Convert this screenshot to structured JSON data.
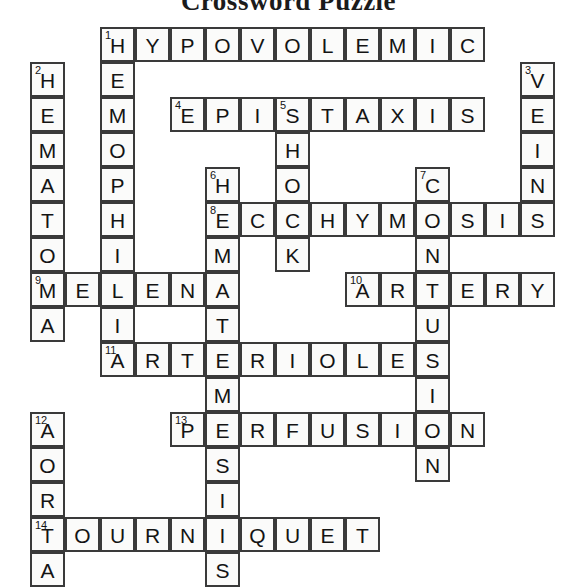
{
  "title": "Crossword Puzzle",
  "grid": {
    "cell_size": 35,
    "origin_x": 30,
    "origin_y": 27,
    "columns": 15,
    "rows": 16,
    "border_color": "#3a3a3a",
    "cell_fill": "#fbfbfa",
    "text_color": "#141414"
  },
  "entries": [
    {
      "number": 1,
      "direction": "across",
      "answer": "HYPOVOLEMIC",
      "row": 0,
      "col": 2,
      "length": 11
    },
    {
      "number": 1,
      "direction": "down",
      "answer": "HEMOPHILIA",
      "row": 0,
      "col": 2,
      "length": 10
    },
    {
      "number": 2,
      "direction": "down",
      "answer": "HEMATOMA",
      "row": 1,
      "col": 0,
      "length": 8
    },
    {
      "number": 3,
      "direction": "down",
      "answer": "VEINS",
      "row": 1,
      "col": 14,
      "length": 5
    },
    {
      "number": 4,
      "direction": "across",
      "answer": "EPISTAXIS",
      "row": 2,
      "col": 4,
      "length": 9
    },
    {
      "number": 5,
      "direction": "down",
      "answer": "SHOCK",
      "row": 2,
      "col": 7,
      "length": 5
    },
    {
      "number": 6,
      "direction": "down",
      "answer": "HEMATEMESIS",
      "row": 4,
      "col": 5,
      "length": 11
    },
    {
      "number": 7,
      "direction": "down",
      "answer": "CONTUSION",
      "row": 4,
      "col": 11,
      "length": 9
    },
    {
      "number": 8,
      "direction": "across",
      "answer": "ECCHYMOSIS",
      "row": 5,
      "col": 5,
      "length": 10
    },
    {
      "number": 9,
      "direction": "across",
      "answer": "MELENA",
      "row": 7,
      "col": 0,
      "length": 6
    },
    {
      "number": 10,
      "direction": "across",
      "answer": "ARTERY",
      "row": 7,
      "col": 9,
      "length": 6
    },
    {
      "number": 11,
      "direction": "across",
      "answer": "ARTERIOLES",
      "row": 9,
      "col": 2,
      "length": 10
    },
    {
      "number": 12,
      "direction": "down",
      "answer": "AORTA",
      "row": 11,
      "col": 0,
      "length": 5
    },
    {
      "number": 13,
      "direction": "across",
      "answer": "PERFUSION",
      "row": 12,
      "col": 4,
      "length": 9
    },
    {
      "number": 14,
      "direction": "across",
      "answer": "TOURNIQUET",
      "row": 14,
      "col": 0,
      "length": 10
    }
  ],
  "cells": [
    {
      "row": 0,
      "col": 2,
      "letter": "H",
      "number": 1
    },
    {
      "row": 0,
      "col": 3,
      "letter": "Y"
    },
    {
      "row": 0,
      "col": 4,
      "letter": "P"
    },
    {
      "row": 0,
      "col": 5,
      "letter": "O"
    },
    {
      "row": 0,
      "col": 6,
      "letter": "V"
    },
    {
      "row": 0,
      "col": 7,
      "letter": "O"
    },
    {
      "row": 0,
      "col": 8,
      "letter": "L"
    },
    {
      "row": 0,
      "col": 9,
      "letter": "E"
    },
    {
      "row": 0,
      "col": 10,
      "letter": "M"
    },
    {
      "row": 0,
      "col": 11,
      "letter": "I"
    },
    {
      "row": 0,
      "col": 12,
      "letter": "C"
    },
    {
      "row": 1,
      "col": 0,
      "letter": "H",
      "number": 2
    },
    {
      "row": 1,
      "col": 2,
      "letter": "E"
    },
    {
      "row": 1,
      "col": 14,
      "letter": "V",
      "number": 3
    },
    {
      "row": 2,
      "col": 0,
      "letter": "E"
    },
    {
      "row": 2,
      "col": 2,
      "letter": "M"
    },
    {
      "row": 2,
      "col": 4,
      "letter": "E",
      "number": 4
    },
    {
      "row": 2,
      "col": 5,
      "letter": "P"
    },
    {
      "row": 2,
      "col": 6,
      "letter": "I"
    },
    {
      "row": 2,
      "col": 7,
      "letter": "S",
      "number": 5
    },
    {
      "row": 2,
      "col": 8,
      "letter": "T"
    },
    {
      "row": 2,
      "col": 9,
      "letter": "A"
    },
    {
      "row": 2,
      "col": 10,
      "letter": "X"
    },
    {
      "row": 2,
      "col": 11,
      "letter": "I"
    },
    {
      "row": 2,
      "col": 12,
      "letter": "S"
    },
    {
      "row": 2,
      "col": 14,
      "letter": "E"
    },
    {
      "row": 3,
      "col": 0,
      "letter": "M"
    },
    {
      "row": 3,
      "col": 2,
      "letter": "O"
    },
    {
      "row": 3,
      "col": 7,
      "letter": "H"
    },
    {
      "row": 3,
      "col": 14,
      "letter": "I"
    },
    {
      "row": 4,
      "col": 0,
      "letter": "A"
    },
    {
      "row": 4,
      "col": 2,
      "letter": "P"
    },
    {
      "row": 4,
      "col": 5,
      "letter": "H",
      "number": 6
    },
    {
      "row": 4,
      "col": 7,
      "letter": "O"
    },
    {
      "row": 4,
      "col": 11,
      "letter": "C",
      "number": 7
    },
    {
      "row": 4,
      "col": 14,
      "letter": "N"
    },
    {
      "row": 5,
      "col": 0,
      "letter": "T"
    },
    {
      "row": 5,
      "col": 2,
      "letter": "H"
    },
    {
      "row": 5,
      "col": 5,
      "letter": "E",
      "number": 8
    },
    {
      "row": 5,
      "col": 6,
      "letter": "C"
    },
    {
      "row": 5,
      "col": 7,
      "letter": "C"
    },
    {
      "row": 5,
      "col": 8,
      "letter": "H"
    },
    {
      "row": 5,
      "col": 9,
      "letter": "Y"
    },
    {
      "row": 5,
      "col": 10,
      "letter": "M"
    },
    {
      "row": 5,
      "col": 11,
      "letter": "O"
    },
    {
      "row": 5,
      "col": 12,
      "letter": "S"
    },
    {
      "row": 5,
      "col": 13,
      "letter": "I"
    },
    {
      "row": 5,
      "col": 14,
      "letter": "S"
    },
    {
      "row": 6,
      "col": 0,
      "letter": "O"
    },
    {
      "row": 6,
      "col": 2,
      "letter": "I"
    },
    {
      "row": 6,
      "col": 5,
      "letter": "M"
    },
    {
      "row": 6,
      "col": 7,
      "letter": "K"
    },
    {
      "row": 6,
      "col": 11,
      "letter": "N"
    },
    {
      "row": 7,
      "col": 0,
      "letter": "M",
      "number": 9
    },
    {
      "row": 7,
      "col": 1,
      "letter": "E"
    },
    {
      "row": 7,
      "col": 2,
      "letter": "L"
    },
    {
      "row": 7,
      "col": 3,
      "letter": "E"
    },
    {
      "row": 7,
      "col": 4,
      "letter": "N"
    },
    {
      "row": 7,
      "col": 5,
      "letter": "A"
    },
    {
      "row": 7,
      "col": 9,
      "letter": "A",
      "number": 10
    },
    {
      "row": 7,
      "col": 10,
      "letter": "R"
    },
    {
      "row": 7,
      "col": 11,
      "letter": "T"
    },
    {
      "row": 7,
      "col": 12,
      "letter": "E"
    },
    {
      "row": 7,
      "col": 13,
      "letter": "R"
    },
    {
      "row": 7,
      "col": 14,
      "letter": "Y"
    },
    {
      "row": 8,
      "col": 0,
      "letter": "A"
    },
    {
      "row": 8,
      "col": 2,
      "letter": "I"
    },
    {
      "row": 8,
      "col": 5,
      "letter": "T"
    },
    {
      "row": 8,
      "col": 11,
      "letter": "U"
    },
    {
      "row": 9,
      "col": 2,
      "letter": "A",
      "number": 11
    },
    {
      "row": 9,
      "col": 3,
      "letter": "R"
    },
    {
      "row": 9,
      "col": 4,
      "letter": "T"
    },
    {
      "row": 9,
      "col": 5,
      "letter": "E"
    },
    {
      "row": 9,
      "col": 6,
      "letter": "R"
    },
    {
      "row": 9,
      "col": 7,
      "letter": "I"
    },
    {
      "row": 9,
      "col": 8,
      "letter": "O"
    },
    {
      "row": 9,
      "col": 9,
      "letter": "L"
    },
    {
      "row": 9,
      "col": 10,
      "letter": "E"
    },
    {
      "row": 9,
      "col": 11,
      "letter": "S"
    },
    {
      "row": 10,
      "col": 5,
      "letter": "M"
    },
    {
      "row": 10,
      "col": 11,
      "letter": "I"
    },
    {
      "row": 11,
      "col": 0,
      "letter": "A",
      "number": 12
    },
    {
      "row": 11,
      "col": 4,
      "letter": "P",
      "number": 13
    },
    {
      "row": 11,
      "col": 5,
      "letter": "E"
    },
    {
      "row": 11,
      "col": 6,
      "letter": "R"
    },
    {
      "row": 11,
      "col": 7,
      "letter": "F"
    },
    {
      "row": 11,
      "col": 8,
      "letter": "U"
    },
    {
      "row": 11,
      "col": 9,
      "letter": "S"
    },
    {
      "row": 11,
      "col": 10,
      "letter": "I"
    },
    {
      "row": 11,
      "col": 11,
      "letter": "O"
    },
    {
      "row": 11,
      "col": 12,
      "letter": "N"
    },
    {
      "row": 12,
      "col": 0,
      "letter": "O"
    },
    {
      "row": 12,
      "col": 5,
      "letter": "S"
    },
    {
      "row": 12,
      "col": 11,
      "letter": "N"
    },
    {
      "row": 13,
      "col": 0,
      "letter": "R"
    },
    {
      "row": 13,
      "col": 5,
      "letter": "I"
    },
    {
      "row": 14,
      "col": 0,
      "letter": "T",
      "number": 14
    },
    {
      "row": 14,
      "col": 1,
      "letter": "O"
    },
    {
      "row": 14,
      "col": 2,
      "letter": "U"
    },
    {
      "row": 14,
      "col": 3,
      "letter": "R"
    },
    {
      "row": 14,
      "col": 4,
      "letter": "N"
    },
    {
      "row": 14,
      "col": 5,
      "letter": "I"
    },
    {
      "row": 14,
      "col": 6,
      "letter": "Q"
    },
    {
      "row": 14,
      "col": 7,
      "letter": "U"
    },
    {
      "row": 14,
      "col": 8,
      "letter": "E"
    },
    {
      "row": 14,
      "col": 9,
      "letter": "T"
    },
    {
      "row": 15,
      "col": 0,
      "letter": "A"
    },
    {
      "row": 15,
      "col": 5,
      "letter": "S"
    }
  ]
}
